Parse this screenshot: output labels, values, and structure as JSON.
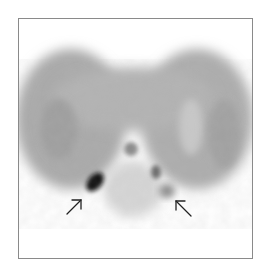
{
  "figure": {
    "description": "Grayscale nuclear medicine scan (transaxial slice) showing bilateral lung fields with focal areas of increased uptake at the posterior bases, indicated by two arrows",
    "colors": {
      "background": "#ffffff",
      "frame_border": "#8a8a8a",
      "lung_field": "#a8a8a8",
      "lung_field_light": "#c4c4c4",
      "hotspot": "#111111",
      "arrow": "#222222"
    },
    "annotations": [
      {
        "type": "arrow",
        "label": "left-arrow",
        "direction": "up-right",
        "points_to": "focal dark uptake, left posterior base"
      },
      {
        "type": "arrow",
        "label": "right-arrow",
        "direction": "up-left",
        "points_to": "faint uptake, right posterior base"
      }
    ]
  }
}
